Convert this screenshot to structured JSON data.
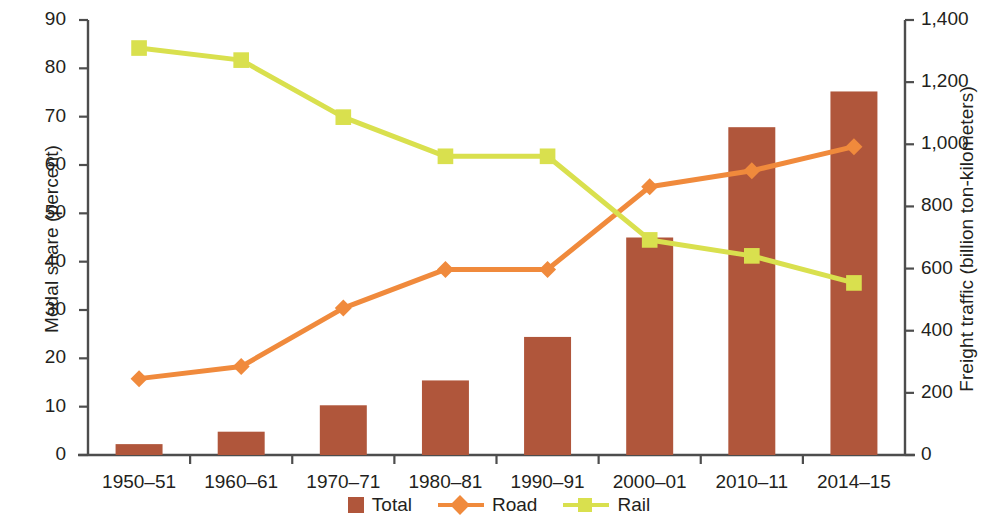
{
  "chart_data": {
    "type": "bar",
    "title": "",
    "subtitle": "",
    "xlabel": "",
    "ylabel": "Modal share (percent)",
    "y2label": "Freight traffic (billion ton-kilometers)",
    "categories": [
      "1950–51",
      "1960–61",
      "1970–71",
      "1980–81",
      "1990–91",
      "2000–01",
      "2010–11",
      "2014–15"
    ],
    "ylim": [
      0,
      90
    ],
    "y2lim": [
      0,
      1400
    ],
    "yticks": [
      0,
      10,
      20,
      30,
      40,
      50,
      60,
      70,
      80,
      90
    ],
    "ytick_labels": [
      "0",
      "10",
      "20",
      "30",
      "40",
      "50",
      "60",
      "70",
      "80",
      "90"
    ],
    "y2ticks": [
      0,
      200,
      400,
      600,
      800,
      1000,
      1200,
      1400
    ],
    "y2tick_labels": [
      "0",
      "200",
      "400",
      "600",
      "800",
      "1,000",
      "1,200",
      "1,400"
    ],
    "grid": false,
    "legend_position": "bottom",
    "series": [
      {
        "name": "Total",
        "type": "bar",
        "axis": "right",
        "unit": "billion ton-kilometers",
        "color": "#b0563b",
        "values": [
          35,
          75,
          160,
          240,
          380,
          700,
          1055,
          1170
        ],
        "values_percent_axis": [
          2.3,
          4.8,
          10.2,
          15.4,
          24.5,
          45.3,
          67.8,
          75.3
        ]
      },
      {
        "name": "Road",
        "type": "line",
        "axis": "left",
        "unit": "percent",
        "color": "#f08a3c",
        "marker": "diamond",
        "values": [
          15.8,
          18.3,
          30.4,
          38.4,
          38.4,
          55.5,
          58.8,
          63.8
        ]
      },
      {
        "name": "Rail",
        "type": "line",
        "axis": "left",
        "unit": "percent",
        "color": "#d9e04e",
        "marker": "square",
        "values": [
          84.2,
          81.7,
          69.9,
          61.8,
          61.8,
          44.5,
          41.2,
          35.6
        ]
      }
    ]
  },
  "legend": {
    "items": [
      {
        "label": "Total",
        "marker": "bar",
        "color": "#b0563b"
      },
      {
        "label": "Road",
        "marker": "diamond",
        "color": "#f08a3c"
      },
      {
        "label": "Rail",
        "marker": "square",
        "color": "#d9e04e"
      }
    ]
  },
  "colors": {
    "bar": "#b0563b",
    "road": "#f08a3c",
    "rail": "#d9e04e",
    "axis": "#4d4d4d",
    "text": "#231f20",
    "background": "#ffffff"
  }
}
